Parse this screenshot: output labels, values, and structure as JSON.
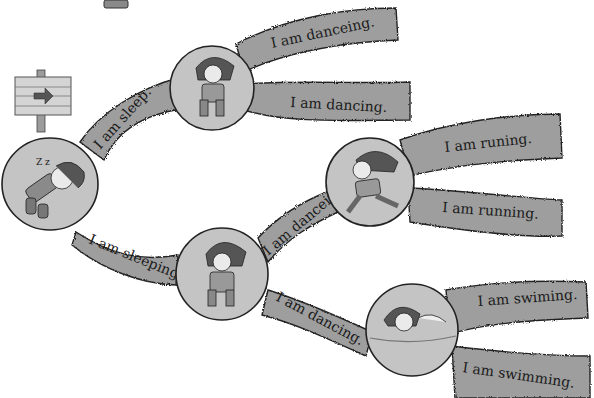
{
  "maze": {
    "start": {
      "label": "sleeping-boy",
      "action": "sleeping"
    },
    "branches": [
      {
        "id": "b1",
        "text": "I am sleep.",
        "correct": false
      },
      {
        "id": "b2",
        "text": "I am sleeping.",
        "correct": true
      },
      {
        "id": "b3",
        "text": "I am danceing.",
        "correct": false
      },
      {
        "id": "b4",
        "text": "I am dancing.",
        "correct": true
      },
      {
        "id": "b5",
        "text": "I am danceing.",
        "correct": false
      },
      {
        "id": "b6",
        "text": "I am dancing.",
        "correct": true
      },
      {
        "id": "b7",
        "text": "I am runing.",
        "correct": false
      },
      {
        "id": "b8",
        "text": "I am running.",
        "correct": true
      },
      {
        "id": "b9",
        "text": "I am swiming.",
        "correct": false
      },
      {
        "id": "b10",
        "text": "I am swimming.",
        "correct": true
      }
    ],
    "nodes": [
      {
        "id": "n0",
        "action": "sleeping"
      },
      {
        "id": "n1",
        "action": "dancing"
      },
      {
        "id": "n2",
        "action": "dancing"
      },
      {
        "id": "n3",
        "action": "running"
      },
      {
        "id": "n4",
        "action": "swimming"
      }
    ],
    "signpost": {
      "icon": "arrow-right-icon"
    }
  },
  "colors": {
    "band": "#9a9a9a",
    "band_light": "#b5b5b5",
    "circle": "#bdbdbd",
    "outline": "#2a2a2a",
    "wood": "#d0d0d0"
  }
}
